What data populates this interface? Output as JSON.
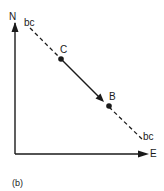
{
  "figure": {
    "caption": "(b)",
    "axes": {
      "x_label": "E",
      "y_label": "N"
    },
    "line_labels": {
      "start": "bc",
      "end": "bc"
    },
    "points": {
      "c": {
        "label": "C"
      },
      "b": {
        "label": "B"
      }
    },
    "colors": {
      "ink": "#1a1a1a",
      "background": "#ffffff"
    }
  }
}
